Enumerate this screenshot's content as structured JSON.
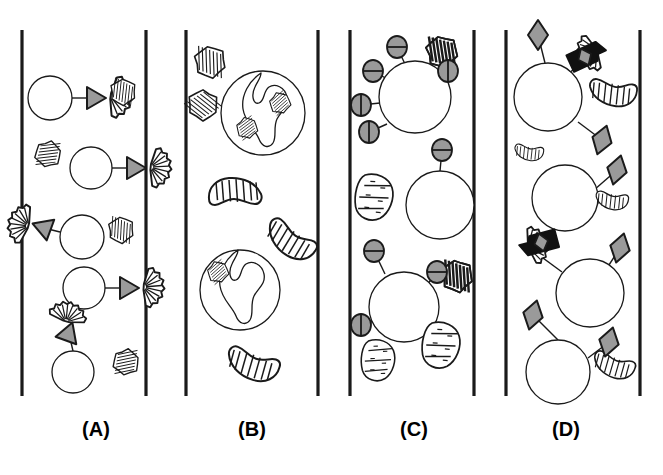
{
  "figure": {
    "background_color": "#ffffff",
    "ink_color": "#1a1a1a",
    "fill_gray": "#9a9a9a",
    "fill_dark": "#111111",
    "width": 663,
    "height": 475
  },
  "panels": [
    {
      "id": "A",
      "label": "(A)",
      "label_x": 96,
      "label_y": 432,
      "channel": {
        "x_left": 22,
        "x_right": 146,
        "y_top": 30,
        "y_bottom": 396
      },
      "description": "Round cells each tethered by a straight line to a gray triangular adhesin that docks onto a fan-shaped hatched microbe; extra free hatched microbes drift nearby.",
      "cells": [
        {
          "cx": 50,
          "cy": 98,
          "r": 22
        },
        {
          "cx": 91,
          "cy": 168,
          "r": 21
        },
        {
          "cx": 82,
          "cy": 237,
          "r": 22
        },
        {
          "cx": 84,
          "cy": 288,
          "r": 21
        },
        {
          "cx": 73,
          "cy": 372,
          "r": 21
        }
      ],
      "connectors": [
        {
          "x1": 72,
          "y1": 98,
          "x2": 88,
          "y2": 98
        },
        {
          "x1": 112,
          "y1": 168,
          "x2": 128,
          "y2": 168
        },
        {
          "x1": 60,
          "y1": 232,
          "x2": 48,
          "y2": 229
        },
        {
          "x1": 105,
          "y1": 288,
          "x2": 121,
          "y2": 288
        },
        {
          "x1": 73,
          "y1": 351,
          "x2": 70,
          "y2": 338
        }
      ],
      "triangles": [
        {
          "cx": 96,
          "cy": 98,
          "rot": 0
        },
        {
          "cx": 136,
          "cy": 168,
          "rot": 0
        },
        {
          "cx": 42,
          "cy": 227,
          "rot": 200
        },
        {
          "cx": 129,
          "cy": 288,
          "rot": 0
        },
        {
          "cx": 69,
          "cy": 332,
          "rot": 290
        }
      ],
      "fans": [
        {
          "cx": 110,
          "cy": 96,
          "rot": 8,
          "scale": 1.05
        },
        {
          "cx": 150,
          "cy": 167,
          "rot": 6,
          "scale": 1.0
        },
        {
          "cx": 29,
          "cy": 226,
          "rot": 196,
          "scale": 1.0
        },
        {
          "cx": 143,
          "cy": 287,
          "rot": 4,
          "scale": 1.0
        },
        {
          "cx": 66,
          "cy": 322,
          "rot": 284,
          "scale": 0.95
        }
      ],
      "microbes": [
        {
          "cx": 123,
          "cy": 92,
          "rot": 28,
          "scale": 0.62,
          "style": "hatched"
        },
        {
          "cx": 48,
          "cy": 154,
          "rot": 105,
          "scale": 0.62,
          "style": "hatched"
        },
        {
          "cx": 121,
          "cy": 230,
          "rot": 25,
          "scale": 0.62,
          "style": "hatched"
        },
        {
          "cx": 126,
          "cy": 362,
          "rot": 100,
          "scale": 0.62,
          "style": "hatched"
        }
      ]
    },
    {
      "id": "B",
      "label": "(B)",
      "label_x": 252,
      "label_y": 432,
      "channel": {
        "x_left": 186,
        "x_right": 318,
        "y_top": 30,
        "y_bottom": 396
      },
      "description": "Large round cells enclosing a lobed pseudopod outline that has engulfed small hatched microbes; additional free microbes float in the channel.",
      "phagocytes": [
        {
          "cx": 263,
          "cy": 113,
          "r": 42,
          "internal_blobs": [
            {
              "cx": 247,
              "cy": 128,
              "rot": 75,
              "scale": 0.5
            },
            {
              "cx": 280,
              "cy": 103,
              "rot": 70,
              "scale": 0.5
            }
          ]
        },
        {
          "cx": 240,
          "cy": 290,
          "r": 40,
          "internal_blobs": [
            {
              "cx": 218,
              "cy": 272,
              "rot": 70,
              "scale": 0.5
            }
          ]
        }
      ],
      "microbes": [
        {
          "cx": 210,
          "cy": 62,
          "rot": 20,
          "scale": 0.75,
          "style": "hatched"
        },
        {
          "cx": 203,
          "cy": 105,
          "rot": 150,
          "scale": 0.72,
          "style": "hatched"
        },
        {
          "cx": 235,
          "cy": 193,
          "rot": 0,
          "scale": 1.0,
          "style": "crescent"
        },
        {
          "cx": 291,
          "cy": 240,
          "rot": 215,
          "scale": 1.0,
          "style": "crescent"
        },
        {
          "cx": 253,
          "cy": 364,
          "rot": 200,
          "scale": 1.0,
          "style": "crescent"
        }
      ]
    },
    {
      "id": "C",
      "label": "(C)",
      "label_x": 414,
      "label_y": 432,
      "channel": {
        "x_left": 350,
        "x_right": 474,
        "y_top": 30,
        "y_bottom": 396
      },
      "description": "Round cells studded with short stalks ending in small gray split-circle receptors oriented either horizontally or vertically; stippled lozenge microbes lie free in the channel.",
      "cells": [
        {
          "cx": 415,
          "cy": 97,
          "r": 36
        },
        {
          "cx": 440,
          "cy": 205,
          "r": 34
        },
        {
          "cx": 404,
          "cy": 307,
          "r": 35
        }
      ],
      "receptors": [
        {
          "cx": 397,
          "cy": 47,
          "stalk_x": 405,
          "stalk_y": 64,
          "divider": "horizontal"
        },
        {
          "cx": 373,
          "cy": 71,
          "stalk_x": 389,
          "stalk_y": 80,
          "divider": "horizontal"
        },
        {
          "cx": 361,
          "cy": 105,
          "stalk_x": 380,
          "stalk_y": 103,
          "divider": "vertical"
        },
        {
          "cx": 369,
          "cy": 132,
          "stalk_x": 387,
          "stalk_y": 124,
          "divider": "vertical"
        },
        {
          "cx": 448,
          "cy": 71,
          "stalk_x": 437,
          "stalk_y": 80,
          "divider": "vertical"
        },
        {
          "cx": 442,
          "cy": 150,
          "stalk_x": 440,
          "stalk_y": 171,
          "divider": "horizontal"
        },
        {
          "cx": 374,
          "cy": 251,
          "stalk_x": 385,
          "stalk_y": 274,
          "divider": "horizontal"
        },
        {
          "cx": 437,
          "cy": 272,
          "stalk_x": 427,
          "stalk_y": 285,
          "divider": "horizontal"
        },
        {
          "cx": 361,
          "cy": 325,
          "stalk_x": 377,
          "stalk_y": 320,
          "divider": "vertical"
        }
      ],
      "microbes": [
        {
          "cx": 442,
          "cy": 52,
          "rot": 15,
          "scale": 0.72,
          "style": "dark"
        },
        {
          "cx": 374,
          "cy": 197,
          "rot": 15,
          "scale": 0.95,
          "style": "stipple"
        },
        {
          "cx": 457,
          "cy": 276,
          "rot": 20,
          "scale": 0.72,
          "style": "dark"
        },
        {
          "cx": 378,
          "cy": 360,
          "rot": 10,
          "scale": 0.85,
          "style": "stipple"
        },
        {
          "cx": 441,
          "cy": 345,
          "rot": 15,
          "scale": 0.95,
          "style": "stipple"
        }
      ]
    },
    {
      "id": "D",
      "label": "(D)",
      "label_x": 566,
      "label_y": 432,
      "channel": {
        "x_left": 506,
        "x_right": 640,
        "y_top": 30,
        "y_bottom": 396
      },
      "description": "Round cells linked by long stalks to gray diamond ligands; two fan-shaped microbes carry a thick black hook clamping a gray diamond, bridging microbe to cell.",
      "cells": [
        {
          "cx": 548,
          "cy": 97,
          "r": 34
        },
        {
          "cx": 565,
          "cy": 198,
          "r": 33
        },
        {
          "cx": 590,
          "cy": 293,
          "r": 34
        },
        {
          "cx": 558,
          "cy": 372,
          "r": 32
        }
      ],
      "diamonds": [
        {
          "cx": 538,
          "cy": 35,
          "rot": 0,
          "stalk_x": 545,
          "stalk_y": 63
        },
        {
          "cx": 602,
          "cy": 140,
          "rot": 18,
          "stalk_x": 578,
          "stalk_y": 122
        },
        {
          "cx": 617,
          "cy": 170,
          "rot": 15,
          "stalk_x": 594,
          "stalk_y": 190
        },
        {
          "cx": 620,
          "cy": 248,
          "rot": 15,
          "stalk_x": 607,
          "stalk_y": 268
        },
        {
          "cx": 533,
          "cy": 315,
          "rot": 15,
          "stalk_x": 558,
          "stalk_y": 340
        },
        {
          "cx": 609,
          "cy": 342,
          "rot": 15,
          "stalk_x": 588,
          "stalk_y": 358
        }
      ],
      "hooked_microbes": [
        {
          "cx": 597,
          "cy": 50,
          "rot": 155,
          "scale": 0.95,
          "stalk_x": 568,
          "stalk_y": 74
        },
        {
          "cx": 528,
          "cy": 247,
          "rot": 345,
          "scale": 0.95,
          "stalk_x": 562,
          "stalk_y": 272
        }
      ],
      "microbes": [
        {
          "cx": 613,
          "cy": 92,
          "rot": 190,
          "scale": 0.9,
          "style": "crescent"
        },
        {
          "cx": 529,
          "cy": 152,
          "rot": 190,
          "scale": 0.55,
          "style": "crescent"
        },
        {
          "cx": 612,
          "cy": 200,
          "rot": 190,
          "scale": 0.62,
          "style": "crescent"
        },
        {
          "cx": 614,
          "cy": 365,
          "rot": 200,
          "scale": 0.8,
          "style": "crescent"
        }
      ]
    }
  ]
}
